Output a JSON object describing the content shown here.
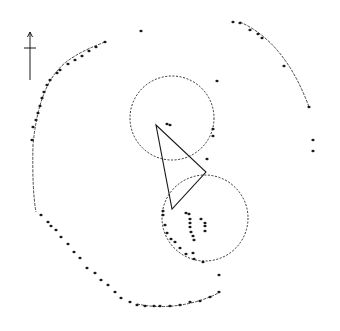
{
  "diagram": {
    "type": "site plan (stone circle / enclosure)",
    "colors": {
      "ink": "#1a1a1a",
      "background": "#ffffff"
    },
    "north_arrow": {
      "x": 30,
      "y_top": 32,
      "y_bottom": 80,
      "crossbar_y": 48
    },
    "circles": [
      {
        "name": "upper-dashed-circle",
        "cx": 172,
        "cy": 118,
        "r": 42
      },
      {
        "name": "lower-dashed-circle",
        "cx": 205,
        "cy": 218,
        "r": 43
      }
    ],
    "triangle": {
      "points": "156,125 206,172 172,209"
    },
    "arcs": [
      {
        "name": "west-arc",
        "d": "M 105 42 Q 70 55 58 70 Q 38 92 33 145 Q 32 190 36 212"
      },
      {
        "name": "northeast-arc",
        "d": "M 240 22 Q 285 42 309 107"
      },
      {
        "name": "south-arc",
        "d": "M 137 304 Q 165 310 195 302 Q 212 297 220 292"
      }
    ],
    "stones": [
      [
        141,
        31
      ],
      [
        105,
        42
      ],
      [
        96,
        47
      ],
      [
        89,
        51
      ],
      [
        82,
        56
      ],
      [
        75,
        60
      ],
      [
        68,
        64
      ],
      [
        60,
        70
      ],
      [
        57,
        73
      ],
      [
        50,
        80
      ],
      [
        47,
        85
      ],
      [
        44,
        92
      ],
      [
        42,
        98
      ],
      [
        40,
        106
      ],
      [
        38,
        113
      ],
      [
        36,
        120
      ],
      [
        33,
        127
      ],
      [
        32,
        140
      ],
      [
        41,
        215
      ],
      [
        48,
        222
      ],
      [
        51,
        226
      ],
      [
        56,
        230
      ],
      [
        61,
        237
      ],
      [
        68,
        244
      ],
      [
        74,
        252
      ],
      [
        80,
        258
      ],
      [
        87,
        268
      ],
      [
        95,
        273
      ],
      [
        101,
        280
      ],
      [
        108,
        285
      ],
      [
        115,
        292
      ],
      [
        121,
        298
      ],
      [
        130,
        302
      ],
      [
        137,
        305
      ],
      [
        145,
        306
      ],
      [
        154,
        306
      ],
      [
        160,
        306
      ],
      [
        170,
        306
      ],
      [
        180,
        305
      ],
      [
        190,
        302
      ],
      [
        200,
        301
      ],
      [
        210,
        297
      ],
      [
        219,
        292
      ],
      [
        233,
        22
      ],
      [
        240,
        23
      ],
      [
        250,
        30
      ],
      [
        258,
        34
      ],
      [
        262,
        38
      ],
      [
        284,
        66
      ],
      [
        309,
        107
      ],
      [
        313,
        140
      ],
      [
        313,
        151
      ],
      [
        219,
        275
      ],
      [
        217,
        81
      ],
      [
        213,
        129
      ],
      [
        213,
        136
      ],
      [
        207,
        159
      ],
      [
        167,
        124
      ],
      [
        170,
        125
      ],
      [
        163,
        211
      ],
      [
        163,
        215
      ],
      [
        165,
        225
      ],
      [
        167,
        233
      ],
      [
        171,
        239
      ],
      [
        175,
        242
      ],
      [
        180,
        248
      ],
      [
        186,
        254
      ],
      [
        194,
        259
      ],
      [
        203,
        262
      ],
      [
        186,
        213
      ],
      [
        189,
        214
      ],
      [
        190,
        219
      ],
      [
        190,
        223
      ],
      [
        190,
        227
      ],
      [
        191,
        232
      ],
      [
        193,
        236
      ],
      [
        194,
        240
      ],
      [
        201,
        219
      ],
      [
        205,
        226
      ],
      [
        205,
        231
      ],
      [
        193,
        253
      ],
      [
        205,
        223
      ]
    ]
  }
}
